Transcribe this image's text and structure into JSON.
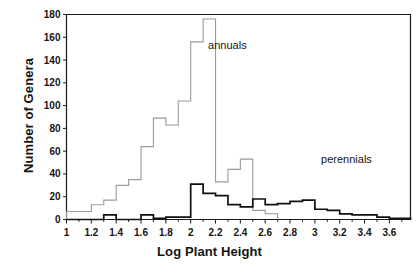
{
  "chart_data": {
    "type": "line",
    "subtype": "step-histogram",
    "title": "",
    "xlabel": "Log Plant Height",
    "ylabel": "Number of Genera",
    "xlim": [
      1.0,
      3.77
    ],
    "ylim": [
      0,
      180
    ],
    "bin_width": 0.1,
    "grid": false,
    "legend_position": "inline-annotations",
    "xticks": [
      "1",
      "1.2",
      "1.4",
      "1.6",
      "1.8",
      "2",
      "2.2",
      "2.4",
      "2.6",
      "2.8",
      "3",
      "3.2",
      "3.4",
      "3.6"
    ],
    "xtick_values": [
      1.0,
      1.2,
      1.4,
      1.6,
      1.8,
      2.0,
      2.2,
      2.4,
      2.6,
      2.8,
      3.0,
      3.2,
      3.4,
      3.6
    ],
    "xtick_minor_values": [
      1.1,
      1.3,
      1.5,
      1.7,
      1.9,
      2.1,
      2.3,
      2.5,
      2.7,
      2.9,
      3.1,
      3.3,
      3.5,
      3.7
    ],
    "yticks": [
      "0",
      "20",
      "40",
      "60",
      "80",
      "100",
      "120",
      "140",
      "160",
      "180"
    ],
    "ytick_values": [
      0,
      20,
      40,
      60,
      80,
      100,
      120,
      140,
      160,
      180
    ],
    "annotations": [
      {
        "name": "annuals",
        "text": "annuals",
        "x": 2.14,
        "y": 152
      },
      {
        "name": "perennials",
        "text": "perennials",
        "x": 3.05,
        "y": 52
      }
    ],
    "series": [
      {
        "name": "annuals",
        "label": "annuals",
        "color": "#9a9a9a",
        "bin_starts": [
          1.0,
          1.1,
          1.2,
          1.3,
          1.4,
          1.5,
          1.6,
          1.7,
          1.8,
          1.9,
          2.0,
          2.1,
          2.2,
          2.3,
          2.4,
          2.5
        ],
        "values": [
          7,
          7,
          13,
          17,
          30,
          35,
          64,
          89,
          83,
          104,
          156,
          176,
          33,
          44,
          53,
          8,
          5
        ]
      },
      {
        "name": "perennials",
        "label": "perennials",
        "color": "#101010",
        "bin_starts": [
          1.0,
          1.1,
          1.2,
          1.3,
          1.4,
          1.5,
          1.6,
          1.7,
          1.8,
          1.9,
          2.0,
          2.1,
          2.2,
          2.3,
          2.4,
          2.5,
          2.6,
          2.7,
          2.8,
          2.9,
          3.0,
          3.1,
          3.2,
          3.3,
          3.4,
          3.5,
          3.6,
          3.7
        ],
        "values": [
          0,
          0,
          0,
          4,
          0,
          0,
          4,
          1,
          2,
          2,
          31,
          23,
          21,
          13,
          11,
          18,
          13,
          14,
          16,
          17,
          9,
          8,
          5,
          4,
          4,
          2,
          1,
          1
        ]
      }
    ]
  },
  "figure": {
    "caption_partial": ""
  }
}
